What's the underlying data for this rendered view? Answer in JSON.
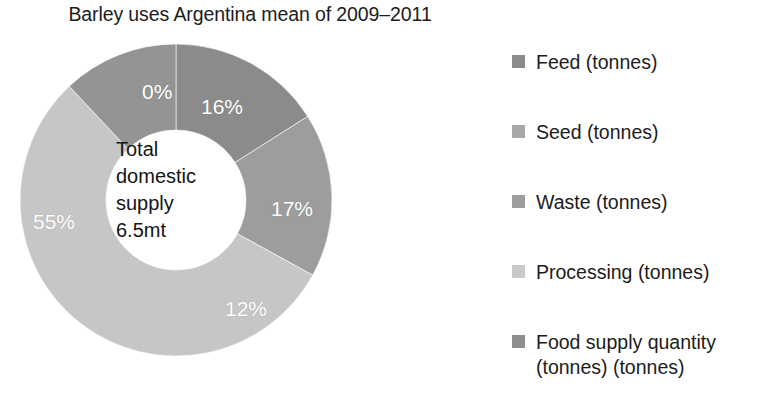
{
  "chart_data": {
    "type": "pie",
    "variant": "donut",
    "title": "Barley uses Argentina mean of 2009–2011",
    "xlabel": "",
    "ylabel": "",
    "legend_position": "right",
    "grid": false,
    "start_angle_deg": 0,
    "direction": "clockwise",
    "center_label": {
      "line1": "Total",
      "line2": "domestic",
      "line3": "supply",
      "line4": "6.5mt",
      "total_value": 6.5,
      "total_units": "mt"
    },
    "categories": [
      "Feed (tonnes)",
      "Seed (tonnes)",
      "Waste (tonnes)",
      "Processing (tonnes)",
      "Food supply quantity (tonnes) (tonnes)"
    ],
    "values": [
      16,
      0,
      17,
      55,
      12
    ],
    "value_labels": [
      "16%",
      "0%",
      "17%",
      "55%",
      "12%"
    ],
    "colors": [
      "#8b8b8b",
      "#a6a6a6",
      "#9d9d9d",
      "#c6c6c6",
      "#949494"
    ],
    "units": "percent"
  },
  "title": {
    "text": "Barley uses Argentina mean of 2009–2011"
  },
  "donut": {
    "center": {
      "line1": "Total",
      "line2": "domestic",
      "line3": "supply",
      "line4": "6.5mt"
    },
    "slices": [
      {
        "name": "feed",
        "label": "16%",
        "value": 16,
        "color": "#8b8b8b"
      },
      {
        "name": "seed",
        "label": "0%",
        "value": 0,
        "color": "#a6a6a6"
      },
      {
        "name": "waste",
        "label": "17%",
        "value": 17,
        "color": "#9d9d9d"
      },
      {
        "name": "processing",
        "label": "55%",
        "value": 55,
        "color": "#c6c6c6"
      },
      {
        "name": "foodsupply",
        "label": "12%",
        "value": 12,
        "color": "#949494"
      }
    ]
  },
  "legend": {
    "items": [
      {
        "label": "Feed (tonnes)",
        "color": "#8b8b8b"
      },
      {
        "label": "Seed (tonnes)",
        "color": "#a8a8a8"
      },
      {
        "label": "Waste (tonnes)",
        "color": "#9d9d9d"
      },
      {
        "label": "Processing (tonnes)",
        "color": "#c9c9c9"
      },
      {
        "label": "Food supply quantity\n(tonnes) (tonnes)",
        "color": "#8e8e8e"
      }
    ]
  }
}
